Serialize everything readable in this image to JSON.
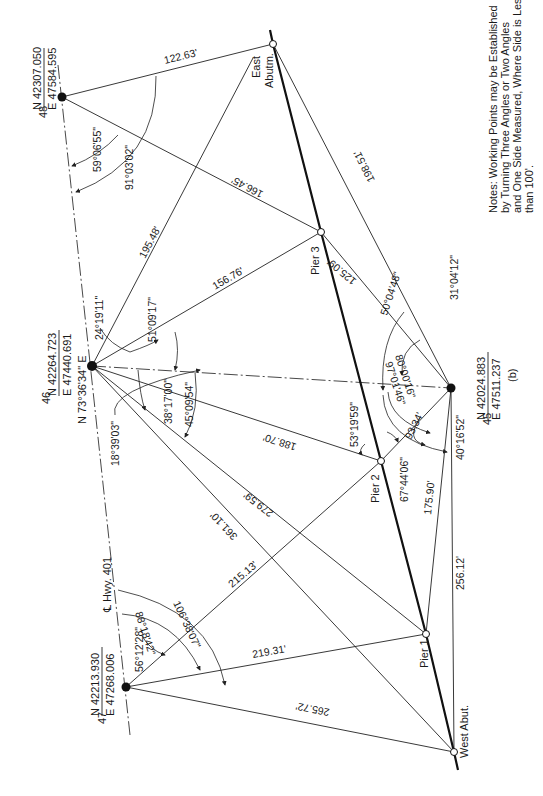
{
  "figure_label": "(b)",
  "notes": {
    "lines": [
      "Notes: Working Points may be Established",
      "by Turning Three Angles or Two Angles",
      "and One Side Measured, Where Side is Less",
      "than 100'."
    ]
  },
  "centerline_label": "℄ Hwy. 401",
  "bearing_label": "N 73°36'34\" E",
  "points": {
    "p48": {
      "id": "48",
      "north": "N 42307.050",
      "east": "E 47584.595",
      "x": 62,
      "y": 97
    },
    "p46": {
      "id": "46",
      "north": "N 42264.723",
      "east": "E 47440.691",
      "x": 92,
      "y": 366
    },
    "p47": {
      "id": "47",
      "north": "N 42213.930",
      "east": "E 47268.006",
      "x": 126,
      "y": 687
    },
    "p45": {
      "id": "45",
      "north": "N 42024.883",
      "east": "E 47511.237",
      "x": 451,
      "y": 388
    },
    "east_abut": {
      "label1": "East",
      "label2": "Abutm.",
      "x": 273,
      "y": 44
    },
    "pier3": {
      "label": "Pier 3",
      "x": 321,
      "y": 232
    },
    "pier2": {
      "label": "Pier 2",
      "x": 381,
      "y": 461
    },
    "pier1": {
      "label": "Pier 1",
      "x": 426,
      "y": 634
    },
    "west_abut": {
      "label": "West Abut.",
      "x": 454,
      "y": 752
    }
  },
  "distances": {
    "d_48_ea": "122.63'",
    "d_48_p3": "166.45'",
    "d_46_ea": "195.48'",
    "d_46_p3": "156.76'",
    "d_45_ea": "198.51'",
    "d_45_p3": "125.09'",
    "d_46_p2": "188.70'",
    "d_46_p1": "279.59'",
    "d_46_wa": "361.10'",
    "d_45_p2": "93.34'",
    "d_45_p1": "175.90'",
    "d_45_wa": "256.12'",
    "d_47_p2": "215.13'",
    "d_47_p1": "219.31'",
    "d_47_wa": "265.72'"
  },
  "angles": {
    "a48_1": "59°06'55\"",
    "a48_2": "91°03'02\"",
    "a46_1": "24°19'11\"",
    "a46_2": "51°09'17\"",
    "a46_3": "38°17'00\"",
    "a46_4": "45°09'54\"",
    "a46_5": "18°39'03\"",
    "a45_1": "31°04'12\"",
    "a45_2": "50°04'48\"",
    "a45_3": "80°00'16\"",
    "a45_4": "97°01'46\"",
    "a45_5": "40°16'52\"",
    "ap2_1": "53°19'59\"",
    "ap2_2": "67°44'06\"",
    "a47_1": "56°12'28\"",
    "a47_2": "88°18'42\"",
    "a47_3": "106°38'07\""
  }
}
